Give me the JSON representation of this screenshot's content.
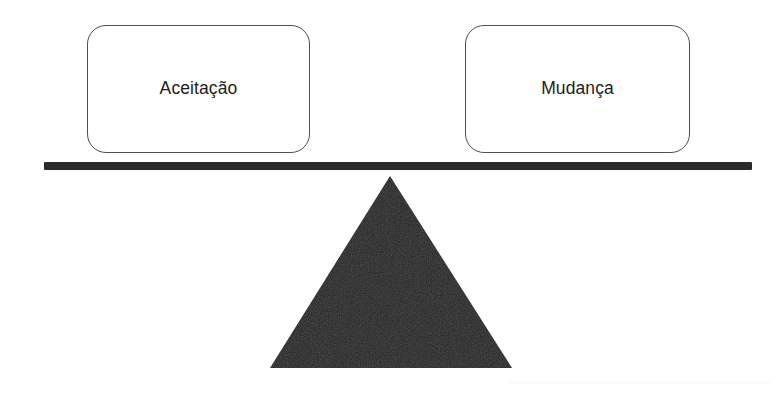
{
  "diagram": {
    "background_color": "#ffffff",
    "beam": {
      "name": "balance-beam",
      "color": "#2b2b2b"
    },
    "fulcrum": {
      "name": "fulcrum-triangle",
      "color": "#262626",
      "shape": "triangle"
    },
    "pans": [
      {
        "id": "left",
        "label": "Aceitação",
        "border_color": "#4f4f4f",
        "fill_color": "#ffffff"
      },
      {
        "id": "right",
        "label": "Mudança",
        "border_color": "#4f4f4f",
        "fill_color": "#ffffff"
      }
    ]
  }
}
